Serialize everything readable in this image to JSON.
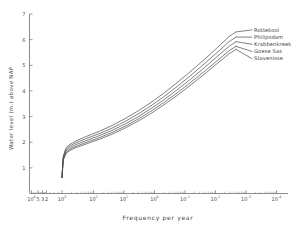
{
  "chart_data": {
    "type": "line",
    "title": "",
    "xlabel": "Frequency per year",
    "ylabel": "Water level (m) above NAP",
    "x_scale": "gumbel-double-log-exceedance",
    "ylim": [
      0,
      7
    ],
    "y_ticks": [
      "1",
      "2",
      "3",
      "4",
      "5",
      "6",
      "7"
    ],
    "grid": false,
    "legend_position": "right-top-inside",
    "x_tick_labels": [
      {
        "mantissa": "10",
        "exponent": "4"
      },
      {
        "mantissa": "5",
        "exponent": ""
      },
      {
        "mantissa": "3",
        "exponent": ""
      },
      {
        "mantissa": "2",
        "exponent": ""
      },
      {
        "mantissa": "10",
        "exponent": "3"
      },
      {
        "mantissa": "10",
        "exponent": "2"
      },
      {
        "mantissa": "10",
        "exponent": "1"
      },
      {
        "mantissa": "10",
        "exponent": "0"
      },
      {
        "mantissa": "10",
        "exponent": "-1"
      },
      {
        "mantissa": "10",
        "exponent": "-2"
      },
      {
        "mantissa": "10",
        "exponent": "-3"
      },
      {
        "mantissa": "10",
        "exponent": "-4"
      }
    ],
    "series": [
      {
        "name": "Rottekooi",
        "values": [
          0.62,
          1.45,
          1.78,
          1.92,
          2.05,
          2.22,
          2.42,
          2.65,
          2.92,
          3.22,
          3.55,
          3.92,
          4.32,
          4.74,
          5.18,
          5.64,
          6.12,
          6.3
        ]
      },
      {
        "name": "Philipsdam",
        "values": [
          0.62,
          1.4,
          1.72,
          1.86,
          1.98,
          2.14,
          2.33,
          2.55,
          2.81,
          3.1,
          3.42,
          3.78,
          4.17,
          4.58,
          5.01,
          5.46,
          5.92,
          6.1
        ]
      },
      {
        "name": "Krabbenkreek",
        "values": [
          0.62,
          1.36,
          1.66,
          1.79,
          1.91,
          2.06,
          2.25,
          2.46,
          2.71,
          2.99,
          3.31,
          3.66,
          4.04,
          4.44,
          4.86,
          5.3,
          5.74,
          5.92
        ]
      },
      {
        "name": "Goese Sas",
        "values": [
          0.62,
          1.32,
          1.6,
          1.73,
          1.84,
          1.99,
          2.17,
          2.38,
          2.62,
          2.9,
          3.21,
          3.55,
          3.92,
          4.31,
          4.72,
          5.14,
          5.57,
          5.74
        ]
      },
      {
        "name": "Stavenisse",
        "values": [
          0.62,
          1.29,
          1.56,
          1.68,
          1.79,
          1.93,
          2.11,
          2.31,
          2.55,
          2.82,
          3.12,
          3.46,
          3.82,
          4.21,
          4.61,
          5.03,
          5.45,
          5.62
        ]
      }
    ]
  },
  "legend": {
    "entries": [
      {
        "label": "Rottekooi"
      },
      {
        "label": "Philipsdam"
      },
      {
        "label": "Krabbenkreek"
      },
      {
        "label": "Goese Sas"
      },
      {
        "label": "Stavenisse"
      }
    ]
  },
  "axes": {
    "x_title": "Frequency  per  year",
    "y_title": "Water  level  (m.)  above  NAP"
  }
}
